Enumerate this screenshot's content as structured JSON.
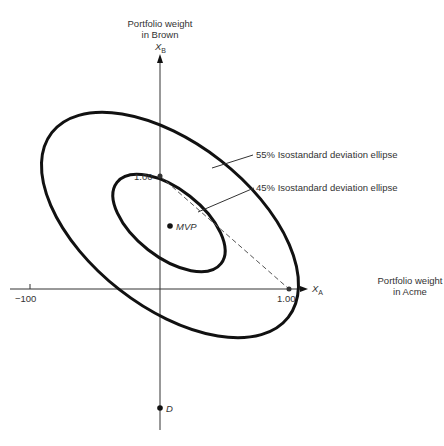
{
  "diagram": {
    "type": "isostandard-deviation-ellipses",
    "y_axis": {
      "title_line1": "Portfolio weight",
      "title_line2": "in Brown",
      "symbol": "X",
      "symbol_sub": "B",
      "tick_label": "1.00"
    },
    "x_axis": {
      "title_line1": "Portfolio weight",
      "title_line2": "in Acme",
      "symbol": "X",
      "symbol_sub": "A",
      "tick_label_pos": "1.00",
      "tick_label_neg": "−100"
    },
    "ellipses": [
      {
        "label": "55% Isostandard deviation ellipse",
        "level": "55%"
      },
      {
        "label": "45% Isostandard deviation ellipse",
        "level": "45%"
      }
    ],
    "points": {
      "mvp": "MVP",
      "d": "D"
    },
    "colors": {
      "ink": "#111111",
      "dashed_line": "#555555",
      "background": "#ffffff"
    }
  }
}
